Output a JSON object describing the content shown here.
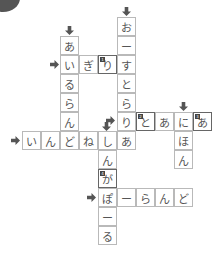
{
  "puzzle": {
    "type": "crossword-katakana-countries",
    "cell_size": 19,
    "words": [
      {
        "id": "airurando",
        "direction": "down",
        "text": "あいるらん"
      },
      {
        "id": "igirisu",
        "direction": "across",
        "text": "いぎり"
      },
      {
        "id": "oosutoraria",
        "direction": "down",
        "text": "おーすとらり"
      },
      {
        "id": "toania",
        "direction": "across",
        "text": "りとあにあ"
      },
      {
        "id": "nihon",
        "direction": "down",
        "text": "にほん"
      },
      {
        "id": "indonesia",
        "direction": "across",
        "text": "いんどねしあ"
      },
      {
        "id": "shingapooru",
        "direction": "down",
        "text": "しんがぽーる"
      },
      {
        "id": "poorando",
        "direction": "across",
        "text": "ぽーらんど"
      }
    ],
    "cells": [
      {
        "x": 60,
        "y": 36,
        "ch": "あ"
      },
      {
        "x": 60,
        "y": 55,
        "ch": "い"
      },
      {
        "x": 60,
        "y": 74,
        "ch": "る"
      },
      {
        "x": 60,
        "y": 93,
        "ch": "ら"
      },
      {
        "x": 60,
        "y": 112,
        "ch": "ん"
      },
      {
        "x": 79,
        "y": 55,
        "ch": "ぎ"
      },
      {
        "x": 98,
        "y": 55,
        "ch": "り",
        "badge": "1"
      },
      {
        "x": 117,
        "y": 17,
        "ch": "お"
      },
      {
        "x": 117,
        "y": 36,
        "ch": "ー"
      },
      {
        "x": 117,
        "y": 55,
        "ch": "す"
      },
      {
        "x": 117,
        "y": 74,
        "ch": "と"
      },
      {
        "x": 117,
        "y": 93,
        "ch": "ら"
      },
      {
        "x": 117,
        "y": 112,
        "ch": "り"
      },
      {
        "x": 136,
        "y": 112,
        "ch": "と",
        "badge": "2"
      },
      {
        "x": 155,
        "y": 112,
        "ch": "あ"
      },
      {
        "x": 174,
        "y": 112,
        "ch": "に"
      },
      {
        "x": 193,
        "y": 112,
        "ch": "あ",
        "badge": "3"
      },
      {
        "x": 174,
        "y": 131,
        "ch": "ほ"
      },
      {
        "x": 174,
        "y": 150,
        "ch": "ん"
      },
      {
        "x": 22,
        "y": 131,
        "ch": "い"
      },
      {
        "x": 41,
        "y": 131,
        "ch": "ん"
      },
      {
        "x": 60,
        "y": 131,
        "ch": "ど"
      },
      {
        "x": 79,
        "y": 131,
        "ch": "ね"
      },
      {
        "x": 98,
        "y": 131,
        "ch": "し"
      },
      {
        "x": 117,
        "y": 131,
        "ch": "あ"
      },
      {
        "x": 98,
        "y": 150,
        "ch": "ん"
      },
      {
        "x": 98,
        "y": 169,
        "ch": "が",
        "badge": "4"
      },
      {
        "x": 98,
        "y": 188,
        "ch": "ぽ"
      },
      {
        "x": 98,
        "y": 207,
        "ch": "ー"
      },
      {
        "x": 98,
        "y": 226,
        "ch": "る"
      },
      {
        "x": 117,
        "y": 188,
        "ch": "ー"
      },
      {
        "x": 136,
        "y": 188,
        "ch": "ら"
      },
      {
        "x": 155,
        "y": 188,
        "ch": "ん"
      },
      {
        "x": 174,
        "y": 188,
        "ch": "ど"
      }
    ],
    "arrows": [
      {
        "dir": "down",
        "x": 65,
        "y": 26
      },
      {
        "dir": "down",
        "x": 122,
        "y": 7
      },
      {
        "dir": "down",
        "x": 179,
        "y": 102
      },
      {
        "dir": "down",
        "x": 102,
        "y": 122
      },
      {
        "dir": "right",
        "x": 50,
        "y": 60
      },
      {
        "dir": "right",
        "x": 106,
        "y": 116
      },
      {
        "dir": "right",
        "x": 11,
        "y": 136
      },
      {
        "dir": "right",
        "x": 87,
        "y": 193
      }
    ]
  },
  "colors": {
    "grid_border": "#b9b9b9",
    "text": "#555555",
    "arrow": "#555555",
    "badge": "#444444"
  }
}
